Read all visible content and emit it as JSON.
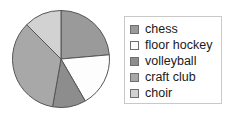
{
  "chart_data": {
    "type": "pie",
    "title": "",
    "legend_position": "right",
    "categories": [
      "chess",
      "floor hockey",
      "volleyball",
      "craft club",
      "choir"
    ],
    "values": [
      24,
      18,
      11,
      35,
      12
    ],
    "angles_deg": [
      85,
      65,
      40,
      125,
      45
    ],
    "colors": [
      "#9a9a9a",
      "#fdfdfd",
      "#8d8d8d",
      "#a8a8a8",
      "#d2d2d2"
    ],
    "slice_edge_color": "#555555",
    "start_angle_deg": 0,
    "direction": "clockwise",
    "slices": [
      {
        "label": "chess",
        "angle_deg": 85,
        "color": "#9a9a9a"
      },
      {
        "label": "floor hockey",
        "angle_deg": 65,
        "color": "#fdfdfd"
      },
      {
        "label": "volleyball",
        "angle_deg": 40,
        "color": "#8d8d8d"
      },
      {
        "label": "craft club",
        "angle_deg": 125,
        "color": "#a8a8a8"
      },
      {
        "label": "choir",
        "angle_deg": 45,
        "color": "#d2d2d2"
      }
    ]
  },
  "legend": {
    "items": [
      {
        "label": "chess",
        "color": "#9a9a9a"
      },
      {
        "label": "floor hockey",
        "color": "#fdfdfd"
      },
      {
        "label": "volleyball",
        "color": "#8d8d8d"
      },
      {
        "label": "craft club",
        "color": "#a8a8a8"
      },
      {
        "label": "choir",
        "color": "#d2d2d2"
      }
    ],
    "border_color": "#c9c9c9"
  }
}
